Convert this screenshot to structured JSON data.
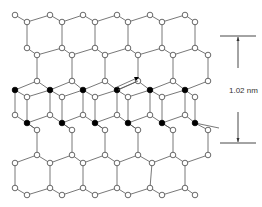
{
  "diagram": {
    "scale_bar": {
      "label": "1.02 nm"
    },
    "legend": {
      "open_atom": "open-circle-atom",
      "filled_atom": "filled-circle-atom"
    },
    "layers": [
      "top-hexagonal-sheet",
      "interlayer-filled-atoms",
      "bottom-hexagonal-sheet"
    ],
    "colors": {
      "bond": "#555555",
      "open_atom_fill": "#ffffff",
      "filled_atom_fill": "#000000",
      "background": "#ffffff"
    }
  }
}
